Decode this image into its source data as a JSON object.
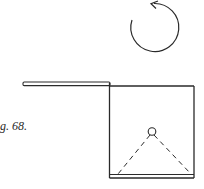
{
  "figure": {
    "caption": "g. 68.",
    "colors": {
      "stroke": "#2a2a2a",
      "background": "#ffffff"
    },
    "elements": {
      "rotation_arrow": {
        "direction": "counterclockwise",
        "cx": 152,
        "cy": 27,
        "r": 24
      },
      "plank": {
        "x1": 23,
        "x2": 110,
        "y": 84
      },
      "box": {
        "left": 109,
        "right": 194,
        "top": 86,
        "bottom": 178
      },
      "pivot_ball": {
        "cx": 152,
        "cy": 132,
        "r": 4
      },
      "dashed_lines": [
        {
          "x1": 152,
          "y1": 136,
          "x2": 118,
          "y2": 174
        },
        {
          "x1": 152,
          "y1": 136,
          "x2": 191,
          "y2": 174
        }
      ]
    }
  }
}
